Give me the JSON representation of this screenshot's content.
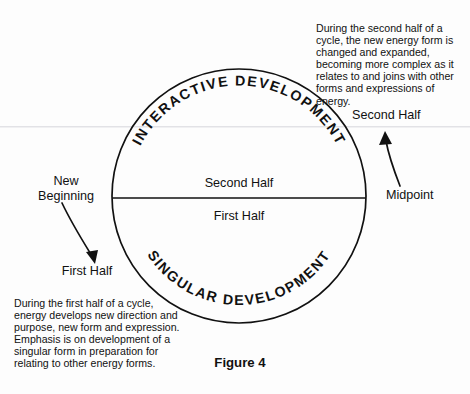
{
  "figure": {
    "caption": "Figure 4",
    "diagram_type": "cycle-circle-diagram"
  },
  "circle": {
    "top_arc_label": "INTERACTIVE DEVELOPMENT",
    "bottom_arc_label": "SINGULAR DEVELOPMENT",
    "upper_half_label": "Second Half",
    "lower_half_label": "First Half"
  },
  "labels": {
    "new_beginning": "New\nBeginning",
    "first_half_left": "First Half",
    "second_half_right": "Second Half",
    "midpoint": "Midpoint"
  },
  "annotations": {
    "top_right_paragraph": "During the second half of a cycle, the new energy form is changed and expanded, becoming more complex as it relates to and joins with other forms and expressions of energy.",
    "bottom_left_paragraph": "During the first half of a cycle, energy develops new direction and purpose, new form and expression. Emphasis is on development of a singular form in preparation for relating to other energy forms."
  },
  "colors": {
    "ink": "#111111",
    "background": "#fdfdfd",
    "artifact_line": "#e2e2e6"
  }
}
